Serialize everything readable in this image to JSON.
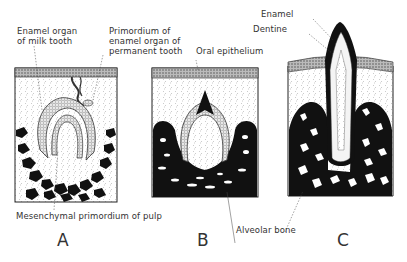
{
  "figure": {
    "type": "scientific-illustration",
    "colors": {
      "ink": "#111111",
      "background": "#ffffff",
      "stipple": "#cccccc"
    }
  },
  "panels": [
    {
      "letter": "A",
      "labels": {
        "enamel_organ_line1": "Enamel organ",
        "enamel_organ_line2": "of milk tooth",
        "primordium_line1": "Primordium of",
        "primordium_line2": "enamel organ of",
        "primordium_line3": "permanent tooth",
        "pulp": "Mesenchymal primordium of pulp"
      }
    },
    {
      "letter": "B",
      "labels": {
        "oral_epithelium": "Oral epithelium",
        "alveolar_bone": "Alveolar bone"
      }
    },
    {
      "letter": "C",
      "labels": {
        "enamel": "Enamel",
        "dentine": "Dentine"
      }
    }
  ]
}
